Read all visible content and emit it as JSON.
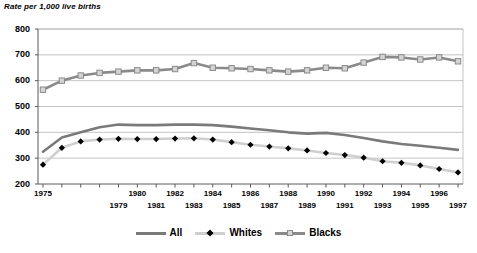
{
  "chart_data": {
    "type": "line",
    "title": "Rate per 1,000 live births",
    "ylabel": "Rate per 1,000 live births",
    "xlabel": "",
    "ylim": [
      200,
      800
    ],
    "yticks": [
      200,
      300,
      400,
      500,
      600,
      700,
      800
    ],
    "grid": true,
    "legend_position": "bottom",
    "categories": [
      1975,
      1976,
      1977,
      1978,
      1979,
      1980,
      1981,
      1982,
      1983,
      1984,
      1985,
      1986,
      1987,
      1988,
      1989,
      1990,
      1991,
      1992,
      1993,
      1994,
      1995,
      1996,
      1997
    ],
    "x_tick_labels_top": [
      "1975",
      "",
      "",
      "",
      "",
      "1980",
      "",
      "1982",
      "",
      "1984",
      "",
      "1986",
      "",
      "1988",
      "",
      "1990",
      "",
      "1992",
      "",
      "1994",
      "",
      "1996",
      ""
    ],
    "x_tick_labels_bottom": [
      "",
      "",
      "",
      "",
      "1979",
      "",
      "1981",
      "",
      "1983",
      "",
      "1985",
      "",
      "1987",
      "",
      "1989",
      "",
      "1991",
      "",
      "1993",
      "",
      "1995",
      "",
      "1997"
    ],
    "series": [
      {
        "name": "All",
        "color": "#7a7a7a",
        "marker": "none",
        "values": [
          325,
          380,
          400,
          420,
          430,
          428,
          428,
          430,
          430,
          428,
          422,
          415,
          408,
          400,
          395,
          398,
          390,
          378,
          365,
          355,
          348,
          340,
          332
        ]
      },
      {
        "name": "Whites",
        "color": "#cfcfcf",
        "marker": "diamond",
        "marker_color": "#000000",
        "values": [
          275,
          340,
          365,
          372,
          375,
          374,
          374,
          376,
          377,
          372,
          362,
          352,
          345,
          338,
          330,
          320,
          312,
          302,
          288,
          282,
          272,
          258,
          245
        ]
      },
      {
        "name": "Blacks",
        "color": "#8a8a8a",
        "marker": "square",
        "marker_color": "#d4d4d4",
        "values": [
          565,
          600,
          620,
          630,
          635,
          640,
          640,
          645,
          668,
          650,
          648,
          645,
          640,
          635,
          640,
          650,
          648,
          670,
          692,
          690,
          682,
          690,
          675
        ]
      }
    ]
  },
  "legend": {
    "entries": [
      {
        "label": "All",
        "marker": "none"
      },
      {
        "label": "Whites",
        "marker": "diamond"
      },
      {
        "label": "Blacks",
        "marker": "square"
      }
    ]
  },
  "colors": {
    "all": "#7a7a7a",
    "whites_line": "#cfcfcf",
    "whites_marker": "#000000",
    "blacks_line": "#8a8a8a",
    "blacks_marker": "#d4d4d4",
    "grid": "#b5b5b5",
    "axis": "#5a5a5a",
    "text": "#000000"
  }
}
